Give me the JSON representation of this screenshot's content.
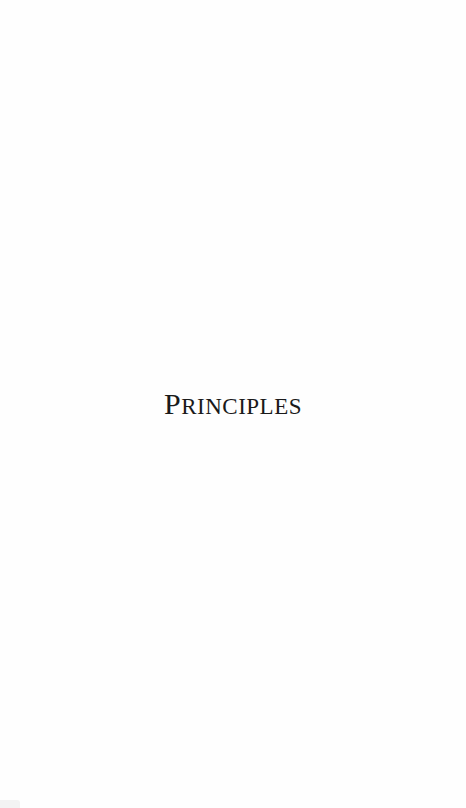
{
  "page": {
    "title_initial": "P",
    "title_rest": "RINCIPLES",
    "title_full": "Principles"
  }
}
